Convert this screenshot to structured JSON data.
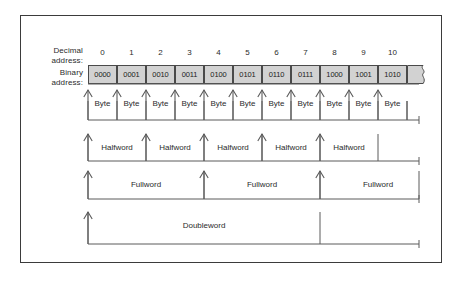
{
  "figure": {
    "labels": {
      "decimal_line1": "Decimal",
      "decimal_line2": "address:",
      "binary_line1": "Binary",
      "binary_line2": "address:"
    },
    "decimal_addresses": [
      "0",
      "1",
      "2",
      "3",
      "4",
      "5",
      "6",
      "7",
      "8",
      "9",
      "10"
    ],
    "binary_addresses": [
      "0000",
      "0001",
      "0010",
      "0011",
      "0100",
      "0101",
      "0110",
      "0111",
      "1000",
      "1001",
      "1010"
    ],
    "unit_rows": [
      {
        "name": "byte",
        "label": "Byte",
        "span_cells": 1,
        "labels": [
          "Byte",
          "Byte",
          "Byte",
          "Byte",
          "Byte",
          "Byte",
          "Byte",
          "Byte",
          "Byte",
          "Byte",
          "Byte"
        ]
      },
      {
        "name": "halfword",
        "label": "Halfword",
        "span_cells": 2,
        "labels": [
          "Halfword",
          "Halfword",
          "Halfword",
          "Halfword",
          "Halfword"
        ]
      },
      {
        "name": "fullword",
        "label": "Fullword",
        "span_cells": 4,
        "labels": [
          "Fullword",
          "Fullword",
          "Fullword"
        ]
      },
      {
        "name": "doubleword",
        "label": "Doubleword",
        "span_cells": 8,
        "labels": [
          "Doubleword"
        ]
      }
    ],
    "colors": {
      "cell_fill": "#d2d2d2",
      "cell_border": "#4a4a4a",
      "frame_border": "#3b3b3b",
      "line": "#5a5a5a",
      "text": "#2b2b2b"
    }
  }
}
